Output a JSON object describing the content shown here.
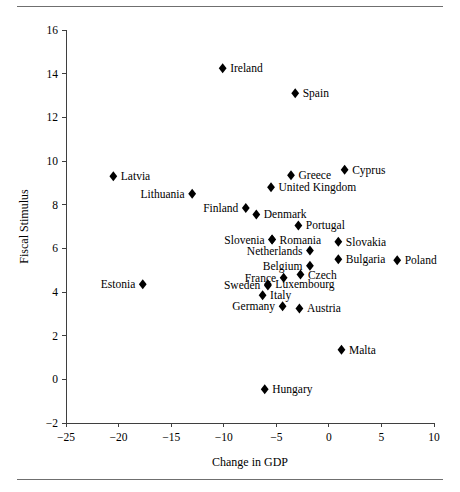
{
  "figure": {
    "has_top_rule": true,
    "has_bottom_rule": true,
    "rule_color": "#6f6f6f",
    "marker_color": "#000000",
    "axis_color": "#3f3f3f"
  },
  "chart_data": {
    "type": "scatter",
    "title": "",
    "xlabel": "Change in GDP",
    "ylabel": "Fiscal Stimulus",
    "xlim": [
      -25,
      10
    ],
    "ylim": [
      -2,
      16
    ],
    "xticks": [
      -25,
      -20,
      -15,
      -10,
      -5,
      0,
      5,
      10
    ],
    "xticklabels": [
      "−25",
      "−20",
      "−15",
      "−10",
      "−5",
      "0",
      "5",
      "10"
    ],
    "yticks": [
      -2,
      0,
      2,
      4,
      6,
      8,
      10,
      12,
      14,
      16
    ],
    "yticklabels": [
      "−2",
      "0",
      "2",
      "4",
      "6",
      "8",
      "10",
      "12",
      "14",
      "16"
    ],
    "grid": false,
    "legend": null,
    "points": [
      {
        "label": "Ireland",
        "x": -10.1,
        "y": 14.25,
        "label_side": "right"
      },
      {
        "label": "Spain",
        "x": -3.2,
        "y": 13.1,
        "label_side": "right"
      },
      {
        "label": "Cyprus",
        "x": 1.5,
        "y": 9.6,
        "label_side": "right"
      },
      {
        "label": "Latvia",
        "x": -20.5,
        "y": 9.3,
        "label_side": "right"
      },
      {
        "label": "Greece",
        "x": -3.6,
        "y": 9.35,
        "label_side": "right"
      },
      {
        "label": "United Kingdom",
        "x": -5.5,
        "y": 8.8,
        "label_side": "right"
      },
      {
        "label": "Lithuania",
        "x": -13.0,
        "y": 8.5,
        "label_side": "left"
      },
      {
        "label": "Finland",
        "x": -7.9,
        "y": 7.85,
        "label_side": "left"
      },
      {
        "label": "Denmark",
        "x": -6.9,
        "y": 7.55,
        "label_side": "right"
      },
      {
        "label": "Portugal",
        "x": -2.9,
        "y": 7.05,
        "label_side": "right"
      },
      {
        "label": "Romania",
        "x": -5.4,
        "y": 6.4,
        "label_side": "right"
      },
      {
        "label": "Slovenia",
        "x": -5.4,
        "y": 6.4,
        "label_side": "left"
      },
      {
        "label": "Slovakia",
        "x": 0.9,
        "y": 6.3,
        "label_side": "right"
      },
      {
        "label": "Netherlands",
        "x": -1.8,
        "y": 5.9,
        "label_side": "left"
      },
      {
        "label": "Bulgaria",
        "x": 0.9,
        "y": 5.5,
        "label_side": "right"
      },
      {
        "label": "Poland",
        "x": 6.5,
        "y": 5.45,
        "label_side": "right"
      },
      {
        "label": "Belgium",
        "x": -1.8,
        "y": 5.2,
        "label_side": "left"
      },
      {
        "label": "Czech",
        "x": -2.7,
        "y": 4.8,
        "label_side": "right"
      },
      {
        "label": "France",
        "x": -4.3,
        "y": 4.65,
        "label_side": "left"
      },
      {
        "label": "Luxembourg",
        "x": -5.8,
        "y": 4.35,
        "label_side": "right"
      },
      {
        "label": "Sweden",
        "x": -5.8,
        "y": 4.3,
        "label_side": "left"
      },
      {
        "label": "Estonia",
        "x": -17.7,
        "y": 4.35,
        "label_side": "left"
      },
      {
        "label": "Italy",
        "x": -6.3,
        "y": 3.85,
        "label_side": "right"
      },
      {
        "label": "Germany",
        "x": -4.4,
        "y": 3.35,
        "label_side": "left"
      },
      {
        "label": "Austria",
        "x": -2.8,
        "y": 3.25,
        "label_side": "right"
      },
      {
        "label": "Malta",
        "x": 1.2,
        "y": 1.35,
        "label_side": "right"
      },
      {
        "label": "Hungary",
        "x": -6.1,
        "y": -0.45,
        "label_side": "right"
      }
    ]
  }
}
